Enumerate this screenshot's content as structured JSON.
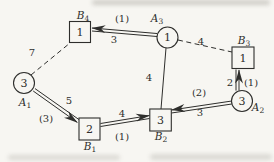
{
  "diagram": {
    "type": "transportation-network-graph",
    "nodes": {
      "A1": {
        "label": "A",
        "sub": "1",
        "value": "3",
        "shape": "circle"
      },
      "A2": {
        "label": "A",
        "sub": "2",
        "value": "3",
        "shape": "circle"
      },
      "A3": {
        "label": "A",
        "sub": "3",
        "value": "1",
        "shape": "circle"
      },
      "B1": {
        "label": "B",
        "sub": "1",
        "value": "2",
        "shape": "square"
      },
      "B2": {
        "label": "B",
        "sub": "2",
        "value": "3",
        "shape": "square"
      },
      "B3": {
        "label": "B",
        "sub": "3",
        "value": "1",
        "shape": "square"
      },
      "B4": {
        "label": "B",
        "sub": "4",
        "value": "1",
        "shape": "square"
      }
    },
    "edges": {
      "A3_B4": {
        "from": "A3",
        "to": "B4",
        "style": "double-line-arrow",
        "flow": "(1)",
        "cost": "3"
      },
      "A1_B4": {
        "from": "A1",
        "to": "B4",
        "style": "dashed",
        "cost": "7"
      },
      "A3_B3": {
        "from": "A3",
        "to": "B3",
        "style": "dashed",
        "cost": "4"
      },
      "A3_B2": {
        "from": "A3",
        "to": "B2",
        "style": "solid",
        "cost": "4"
      },
      "A1_B1": {
        "from": "A1",
        "to": "B1",
        "style": "double-line-arrow",
        "cost": "5",
        "flow": "(3)"
      },
      "B1_B2": {
        "from": "B1",
        "to": "B2",
        "style": "double-line-arrow",
        "cost": "4",
        "flow": "(1)"
      },
      "A2_B2": {
        "from": "A2",
        "to": "B2",
        "style": "double-line-arrow",
        "flow": "(2)",
        "cost": "3"
      },
      "A2_B3": {
        "from": "A2",
        "to": "B3",
        "style": "double-line-arrow",
        "cost": "2",
        "flow": "(1)"
      }
    },
    "colors": {
      "ink": "#2e2e2c",
      "paper": "#f7f6f2"
    }
  }
}
